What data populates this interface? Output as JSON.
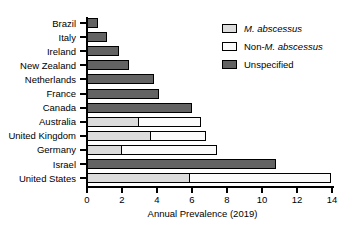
{
  "chart_data": {
    "type": "bar",
    "orientation": "horizontal",
    "stacked": true,
    "title": "",
    "xlabel": "Annual Prevalence (2019)",
    "ylabel": "",
    "xlim": [
      0,
      14
    ],
    "xticks": [
      0,
      2,
      4,
      6,
      8,
      10,
      12,
      14
    ],
    "grid": false,
    "legend_position": "top-right",
    "categories": [
      "Brazil",
      "Italy",
      "Ireland",
      "New Zealand",
      "Netherlands",
      "France",
      "Canada",
      "Australia",
      "United Kingdom",
      "Germany",
      "Israel",
      "United States"
    ],
    "series": [
      {
        "name": "M. abscessus",
        "color": "#dcdcdc",
        "values": [
          0,
          0,
          0,
          0,
          0,
          0,
          0,
          3.0,
          3.7,
          2.0,
          0,
          5.9
        ]
      },
      {
        "name": "Non-M. abscessus",
        "color": "#fbfbfb",
        "values": [
          0,
          0,
          0,
          0,
          0,
          0,
          0,
          3.6,
          3.2,
          5.5,
          0,
          8.1
        ]
      },
      {
        "name": "Unspecified",
        "color": "#636363",
        "values": [
          0.65,
          1.15,
          1.8,
          2.4,
          3.8,
          4.1,
          6.0,
          0,
          0,
          0,
          10.8,
          0
        ]
      }
    ],
    "totals": [
      0.65,
      1.15,
      1.8,
      2.4,
      3.8,
      4.1,
      6.0,
      6.6,
      6.9,
      7.5,
      10.8,
      14.0
    ]
  },
  "legend": {
    "items": [
      {
        "label_prefix": "M. abscessus",
        "label_suffix": "",
        "italic_part": "M. abscessus",
        "plain_lead": "",
        "swatch": "#dcdcdc",
        "name": "m-abscessus"
      },
      {
        "label_prefix": "Non-",
        "label_suffix": "M. abscessus",
        "italic_part": "M. abscessus",
        "plain_lead": "Non-",
        "swatch": "#fbfbfb",
        "name": "non-m-abscessus"
      },
      {
        "label_prefix": "Unspecified",
        "label_suffix": "",
        "italic_part": "",
        "plain_lead": "Unspecified",
        "swatch": "#636363",
        "name": "unspecified"
      }
    ]
  }
}
